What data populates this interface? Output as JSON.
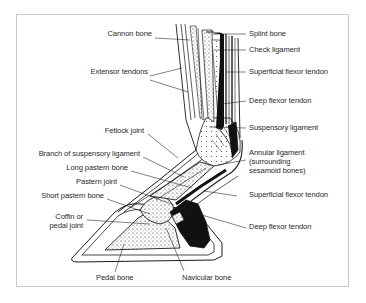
{
  "diagram": {
    "colors": {
      "frame": "#c9c9c9",
      "ink": "#1a1a1a",
      "label": "#2a2a2a",
      "background": "#ffffff"
    },
    "labels_left": [
      {
        "id": "cannon-bone",
        "text": "Cannon bone",
        "x": 102,
        "y": 33,
        "w": 50
      },
      {
        "id": "extensor-tendons",
        "text": "Extensor tendons",
        "x": 88,
        "y": 72,
        "w": 60
      },
      {
        "id": "fetlock-joint",
        "text": "Fetlock joint",
        "x": 100,
        "y": 130,
        "w": 45
      },
      {
        "id": "branch-of-suspensory-ligament",
        "text": "Branch of suspensory ligament",
        "x": 29,
        "y": 153,
        "w": 110
      },
      {
        "id": "long-pastern-bone",
        "text": "Long pastern bone",
        "x": 61,
        "y": 167,
        "w": 66
      },
      {
        "id": "pastern-joint",
        "text": "Pastern joint",
        "x": 72,
        "y": 181,
        "w": 44
      },
      {
        "id": "short-pastern-bone",
        "text": "Short pastern bone",
        "x": 35,
        "y": 195,
        "w": 68
      },
      {
        "id": "coffin-or-pedal-joint",
        "text": "Coffin or\npedal joint",
        "x": 45,
        "y": 215,
        "w": 38
      }
    ],
    "labels_right": [
      {
        "id": "splint-bone",
        "text": "Splint bone",
        "x": 249,
        "y": 30
      },
      {
        "id": "check-ligament",
        "text": "Check ligament",
        "x": 249,
        "y": 46
      },
      {
        "id": "superficial-flexor-tendon-upper",
        "text": "Superficial flexor tendon",
        "x": 249,
        "y": 67
      },
      {
        "id": "deep-flexor-tendon-upper",
        "text": "Deep flexor tendon",
        "x": 249,
        "y": 96
      },
      {
        "id": "suspensory-ligament",
        "text": "Suspensory ligament",
        "x": 249,
        "y": 124
      },
      {
        "id": "annular-ligament",
        "text": "Annular ligament\n(surrounding\nsesamoid bones)",
        "x": 249,
        "y": 148
      },
      {
        "id": "superficial-flexor-tendon-lower",
        "text": "Superficial flexor tendon",
        "x": 249,
        "y": 190
      },
      {
        "id": "deep-flexor-tendon-lower",
        "text": "Deep flexor tendon",
        "x": 249,
        "y": 222
      }
    ],
    "labels_bottom": [
      {
        "id": "pedal-bone",
        "text": "Pedal bone",
        "x": 96,
        "y": 274
      },
      {
        "id": "navicular-bone",
        "text": "Navicular bone",
        "x": 182,
        "y": 274
      }
    ]
  }
}
